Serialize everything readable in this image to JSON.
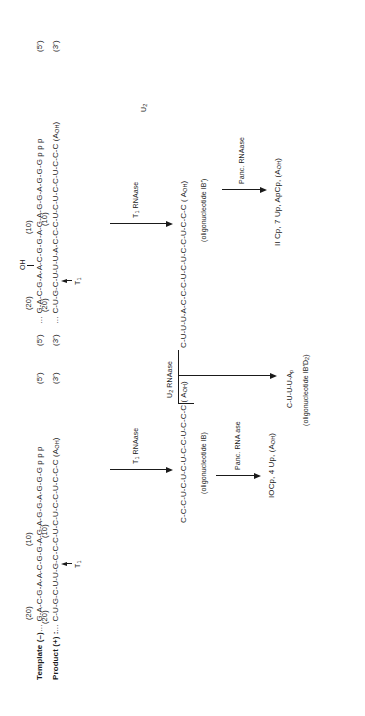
{
  "labels": {
    "template": "Template (–)",
    "product": "Product (+) :"
  },
  "left_fragment": {
    "template_seq": "… G-A-C-G-A-A-C-G-G-A-G-A-G-G-A-G-G-G p p p",
    "template_end": "(5′)",
    "template_pos20": "(20)",
    "template_pos10": "(10)",
    "product_seq": "… C-U-G-C-U-U-G-C-C-C-U-C-U-C-C-U-C-C-C",
    "product_aoh": "(A",
    "product_aoh_sub": "OH",
    "product_aoh_close": ")",
    "product_end": "(3′)",
    "product_pos20": "(20)",
    "product_pos10": "(10)",
    "cut_label": "T",
    "cut_label_sub": "1"
  },
  "right_fragment": {
    "template_start": "(5′)",
    "template_seq": "… G-A-C-G-A-A-C-G-G-A-G-A-G-G-A-G-G-G p p p",
    "template_end": "(5′)",
    "template_pos20": "(20)",
    "template_pos10": "(10)",
    "oh_label": "OH",
    "product_start": "(3′)",
    "product_seq": "… C-U-G-C-U-U-U-A-C-C-C-U-C-U-C-C-U-C-C-C",
    "product_aoh": "(A",
    "product_aoh_sub": "OH",
    "product_aoh_close": ")",
    "product_end": "(3′)",
    "product_pos20": "(20)",
    "product_pos10": "(10)",
    "cut_label": "T",
    "cut_label_sub": "1"
  },
  "steps": {
    "t1_left": {
      "enzyme": "T",
      "enzyme_sub": "1",
      "enzyme_rest": " RNAase"
    },
    "t1_right": {
      "enzyme": "T",
      "enzyme_sub": "1",
      "enzyme_rest": " RNAase"
    },
    "oligo_1b": {
      "seq": "C-C-C-U-C-U-C-U-C-C-U-C-C-C",
      "aoh": "( A",
      "aoh_sub": "OH",
      "aoh_close": ")",
      "name": "(oligonucleotide IB)"
    },
    "oligo_1b_prime": {
      "seq": "C-U-U-U-A-C-C-C-U-C-U-C-C-U-C-C-C",
      "aoh": "( A",
      "aoh_sub": "OH",
      "aoh_close": ")",
      "name": "(oligonucleotide IB′)",
      "u2_label": "U",
      "u2_sub": "2"
    },
    "u2_rnaase": {
      "enzyme": "U",
      "enzyme_sub": "2",
      "enzyme_rest": " RNAase"
    },
    "panc_left": {
      "enzyme": "Panc. RNA ase",
      "product": "IOCp, 4 Up, (A",
      "product_sub": "OH",
      "product_close": ")"
    },
    "panc_right": {
      "enzyme": "Panc. RNAase",
      "product": "II Cp, 7 Up, ApCp, (A",
      "product_sub": "OH",
      "product_close": ")"
    },
    "oligo_d2": {
      "seq": "C-U-U-U-A",
      "seq_sub": "p",
      "name": "(oligonucleotide IB′D",
      "name_sub": "2",
      "name_close": ")"
    }
  }
}
